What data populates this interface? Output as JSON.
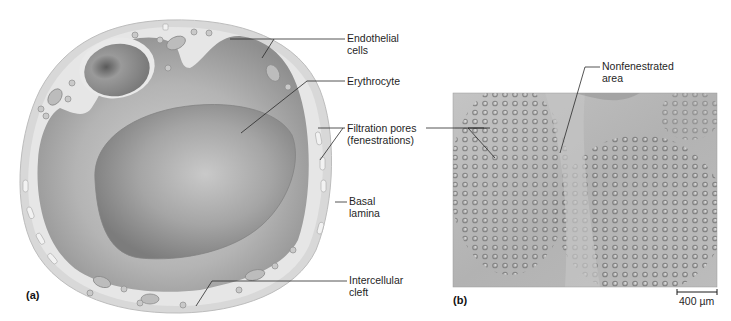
{
  "figure": {
    "panel_a": {
      "letter": "(a)",
      "labels": {
        "endothelial_cells_line1": "Endothelial",
        "endothelial_cells_line2": "cells",
        "erythrocyte": "Erythrocyte",
        "filtration_pores_line1": "Filtration pores",
        "filtration_pores_line2": "(fenestrations)",
        "basal_lamina_line1": "Basal",
        "basal_lamina_line2": "lamina",
        "intercellular_cleft_line1": "Intercellular",
        "intercellular_cleft_line2": "cleft"
      }
    },
    "panel_b": {
      "letter": "(b)",
      "labels": {
        "nonfenestrated_line1": "Nonfenestrated",
        "nonfenestrated_line2": "area"
      },
      "scale_bar": "400 µm"
    },
    "colors": {
      "background": "#ffffff",
      "basal_lamina": "#d6d6d6",
      "endothelium": "#e4e4e4",
      "lumen": "#a8a8a8",
      "erythrocyte": "#9a9a9a",
      "leader_line": "#2a2a2a",
      "micrograph": "#b9b9b9"
    }
  }
}
